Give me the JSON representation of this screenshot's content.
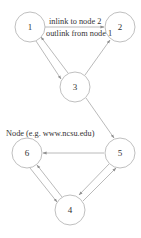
{
  "diagram": {
    "colors": {
      "node_stroke": "#b8b8b8",
      "edge": "#a8a8a8",
      "text": "#333333",
      "background": "#ffffff"
    },
    "nodes": [
      {
        "id": "1",
        "label": "1",
        "cx": 30,
        "cy": 27,
        "r": 15
      },
      {
        "id": "2",
        "label": "2",
        "cx": 120,
        "cy": 27,
        "r": 15
      },
      {
        "id": "3",
        "label": "3",
        "cx": 75,
        "cy": 87,
        "r": 15
      },
      {
        "id": "5",
        "label": "5",
        "cx": 120,
        "cy": 153,
        "r": 15
      },
      {
        "id": "6",
        "label": "6",
        "cx": 27,
        "cy": 153,
        "r": 15
      },
      {
        "id": "4",
        "label": "4",
        "cx": 70,
        "cy": 210,
        "r": 15
      }
    ],
    "edges": [
      {
        "from": "1",
        "to": "2"
      },
      {
        "from": "1",
        "to": "3"
      },
      {
        "from": "3",
        "to": "1"
      },
      {
        "from": "3",
        "to": "2"
      },
      {
        "from": "3",
        "to": "5"
      },
      {
        "from": "5",
        "to": "6"
      },
      {
        "from": "6",
        "to": "4"
      },
      {
        "from": "4",
        "to": "6"
      },
      {
        "from": "4",
        "to": "5"
      },
      {
        "from": "5",
        "to": "4"
      }
    ],
    "annotations": {
      "inlink_label": "inlink to node 2",
      "outlink_label": "outlink from node 1",
      "node_label": "Node (e.g. www.ncsu.edu)"
    }
  }
}
